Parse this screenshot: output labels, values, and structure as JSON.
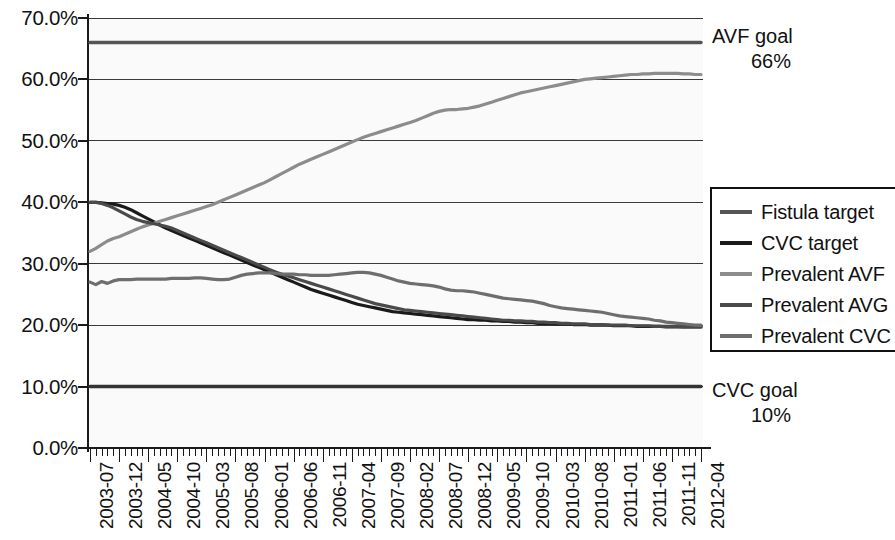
{
  "chart_data": {
    "type": "line",
    "title": "",
    "xlabel": "",
    "ylabel": "",
    "ylim": [
      0,
      0.7
    ],
    "ytick_labels": [
      "70.0%",
      "60.0%",
      "50.0%",
      "40.0%",
      "30.0%",
      "20.0%",
      "10.0%",
      "0.0%"
    ],
    "ytick_values": [
      0.7,
      0.6,
      0.5,
      0.4,
      0.3,
      0.2,
      0.1,
      0.0
    ],
    "grid": true,
    "grid_axis": "y",
    "legend_position": "right",
    "x_tick_labels": [
      "2003-07",
      "2003-12",
      "2004-05",
      "2004-10",
      "2005-03",
      "2005-08",
      "2006-01",
      "2006-06",
      "2006-11",
      "2007-04",
      "2007-09",
      "2008-02",
      "2008-07",
      "2008-12",
      "2009-05",
      "2009-10",
      "2010-03",
      "2010-08",
      "2011-01",
      "2011-06",
      "2011-11",
      "2012-04"
    ],
    "x_tick_label_interval_months": 5,
    "x_range": [
      "2003-07",
      "2012-04"
    ],
    "x_points_total": 106,
    "series": [
      {
        "name": "Fistula target",
        "color": "#555555",
        "style": "flat",
        "constant_value": 0.66,
        "values": [
          0.66,
          0.66
        ]
      },
      {
        "name": "CVC target",
        "color": "#1a1a1a",
        "style": "curve",
        "values": [
          0.4,
          0.4,
          0.399,
          0.398,
          0.397,
          0.395,
          0.392,
          0.388,
          0.383,
          0.378,
          0.373,
          0.368,
          0.363,
          0.358,
          0.354,
          0.35,
          0.346,
          0.342,
          0.338,
          0.334,
          0.33,
          0.326,
          0.322,
          0.318,
          0.314,
          0.31,
          0.306,
          0.302,
          0.298,
          0.294,
          0.29,
          0.286,
          0.282,
          0.278,
          0.274,
          0.27,
          0.266,
          0.262,
          0.258,
          0.255,
          0.252,
          0.249,
          0.246,
          0.243,
          0.24,
          0.237,
          0.234,
          0.232,
          0.23,
          0.228,
          0.226,
          0.224,
          0.222,
          0.221,
          0.22,
          0.219,
          0.218,
          0.217,
          0.216,
          0.215,
          0.214,
          0.213,
          0.212,
          0.211,
          0.21,
          0.209,
          0.209,
          0.208,
          0.208,
          0.207,
          0.207,
          0.206,
          0.206,
          0.205,
          0.205,
          0.204,
          0.204,
          0.203,
          0.203,
          0.203,
          0.202,
          0.202,
          0.202,
          0.201,
          0.201,
          0.201,
          0.2,
          0.2,
          0.2,
          0.2,
          0.199,
          0.199,
          0.199,
          0.199,
          0.198,
          0.198,
          0.198,
          0.198,
          0.198,
          0.197,
          0.197,
          0.197,
          0.197,
          0.197,
          0.197,
          0.197
        ]
      },
      {
        "name": "Prevalent AVF",
        "color": "#8c8c8c",
        "style": "curve",
        "values": [
          0.32,
          0.325,
          0.331,
          0.337,
          0.341,
          0.344,
          0.348,
          0.352,
          0.356,
          0.36,
          0.363,
          0.366,
          0.369,
          0.372,
          0.375,
          0.378,
          0.381,
          0.384,
          0.387,
          0.39,
          0.393,
          0.396,
          0.4,
          0.404,
          0.408,
          0.412,
          0.416,
          0.42,
          0.424,
          0.428,
          0.432,
          0.437,
          0.442,
          0.447,
          0.452,
          0.457,
          0.462,
          0.466,
          0.47,
          0.474,
          0.478,
          0.482,
          0.486,
          0.49,
          0.494,
          0.498,
          0.502,
          0.506,
          0.509,
          0.512,
          0.515,
          0.518,
          0.521,
          0.524,
          0.527,
          0.53,
          0.533,
          0.537,
          0.541,
          0.545,
          0.548,
          0.55,
          0.551,
          0.551,
          0.552,
          0.553,
          0.555,
          0.557,
          0.56,
          0.563,
          0.566,
          0.569,
          0.572,
          0.575,
          0.578,
          0.58,
          0.582,
          0.584,
          0.586,
          0.588,
          0.59,
          0.592,
          0.594,
          0.596,
          0.598,
          0.6,
          0.601,
          0.602,
          0.603,
          0.604,
          0.605,
          0.606,
          0.607,
          0.608,
          0.608,
          0.609,
          0.609,
          0.61,
          0.61,
          0.61,
          0.61,
          0.61,
          0.609,
          0.609,
          0.608,
          0.608
        ]
      },
      {
        "name": "Prevalent AVG",
        "color": "#4a4a4a",
        "style": "curve",
        "values": [
          0.4,
          0.4,
          0.398,
          0.395,
          0.391,
          0.386,
          0.381,
          0.376,
          0.372,
          0.369,
          0.367,
          0.365,
          0.363,
          0.361,
          0.358,
          0.354,
          0.35,
          0.346,
          0.342,
          0.338,
          0.334,
          0.33,
          0.326,
          0.322,
          0.318,
          0.314,
          0.31,
          0.306,
          0.302,
          0.298,
          0.294,
          0.29,
          0.286,
          0.283,
          0.28,
          0.277,
          0.274,
          0.271,
          0.268,
          0.265,
          0.262,
          0.259,
          0.256,
          0.253,
          0.25,
          0.247,
          0.244,
          0.241,
          0.238,
          0.235,
          0.233,
          0.231,
          0.229,
          0.227,
          0.225,
          0.224,
          0.223,
          0.222,
          0.221,
          0.22,
          0.219,
          0.218,
          0.217,
          0.216,
          0.215,
          0.214,
          0.213,
          0.212,
          0.211,
          0.21,
          0.209,
          0.208,
          0.208,
          0.207,
          0.207,
          0.206,
          0.206,
          0.205,
          0.205,
          0.204,
          0.204,
          0.203,
          0.203,
          0.202,
          0.202,
          0.202,
          0.201,
          0.201,
          0.201,
          0.2,
          0.2,
          0.2,
          0.2,
          0.199,
          0.199,
          0.199,
          0.199,
          0.198,
          0.198,
          0.198,
          0.198,
          0.198,
          0.197,
          0.197,
          0.197,
          0.197
        ]
      },
      {
        "name": "Prevalent CVC",
        "color": "#6e6e6e",
        "style": "curve",
        "values": [
          0.27,
          0.266,
          0.271,
          0.268,
          0.272,
          0.274,
          0.274,
          0.274,
          0.275,
          0.275,
          0.275,
          0.275,
          0.275,
          0.275,
          0.276,
          0.276,
          0.276,
          0.276,
          0.277,
          0.277,
          0.276,
          0.275,
          0.274,
          0.274,
          0.275,
          0.278,
          0.281,
          0.283,
          0.284,
          0.285,
          0.285,
          0.285,
          0.284,
          0.283,
          0.283,
          0.283,
          0.282,
          0.282,
          0.281,
          0.281,
          0.281,
          0.281,
          0.282,
          0.283,
          0.284,
          0.285,
          0.286,
          0.286,
          0.285,
          0.283,
          0.281,
          0.278,
          0.275,
          0.272,
          0.27,
          0.268,
          0.267,
          0.266,
          0.265,
          0.264,
          0.262,
          0.259,
          0.257,
          0.256,
          0.256,
          0.255,
          0.254,
          0.252,
          0.25,
          0.248,
          0.246,
          0.244,
          0.243,
          0.242,
          0.241,
          0.24,
          0.239,
          0.237,
          0.235,
          0.232,
          0.23,
          0.228,
          0.227,
          0.226,
          0.225,
          0.224,
          0.223,
          0.222,
          0.221,
          0.219,
          0.217,
          0.215,
          0.214,
          0.213,
          0.212,
          0.211,
          0.21,
          0.208,
          0.207,
          0.205,
          0.204,
          0.203,
          0.202,
          0.201,
          0.2,
          0.2
        ]
      }
    ],
    "annotations": [
      {
        "id": "avf_goal",
        "title": "AVF goal",
        "value": "66%",
        "y": 0.66
      },
      {
        "id": "cvc_goal",
        "title": "CVC goal",
        "value": "10%",
        "y": 0.1
      }
    ],
    "reference_lines": [
      {
        "name": "AVF goal line",
        "value": 0.66,
        "color": "#555555"
      },
      {
        "name": "CVC goal line",
        "value": 0.1,
        "color": "#333333"
      }
    ]
  },
  "legend": {
    "items": [
      {
        "label": "Fistula target",
        "color": "#555555"
      },
      {
        "label": "CVC target",
        "color": "#1a1a1a"
      },
      {
        "label": "Prevalent AVF",
        "color": "#8c8c8c"
      },
      {
        "label": "Prevalent AVG",
        "color": "#4a4a4a"
      },
      {
        "label": "Prevalent CVC",
        "color": "#6e6e6e"
      }
    ]
  }
}
